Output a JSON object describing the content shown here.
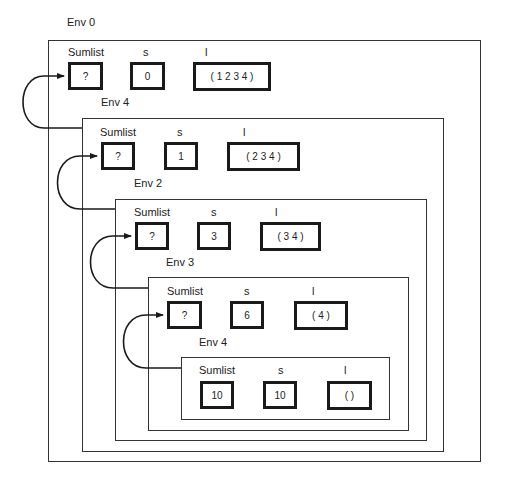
{
  "diagram": {
    "environments": [
      {
        "label": "Env 0",
        "var_labels": [
          "Sumlist",
          "s",
          "l"
        ],
        "values": {
          "sumlist": "?",
          "s": "0",
          "l": "( 1  2  3  4 )"
        }
      },
      {
        "label": "Env 4",
        "var_labels": [
          "Sumlist",
          "s",
          "l"
        ],
        "values": {
          "sumlist": "?",
          "s": "1",
          "l": "( 2  3  4 )"
        }
      },
      {
        "label": "Env 2",
        "var_labels": [
          "Sumlist",
          "s",
          "l"
        ],
        "values": {
          "sumlist": "?",
          "s": "3",
          "l": "( 3  4 )"
        }
      },
      {
        "label": "Env 3",
        "var_labels": [
          "Sumlist",
          "s",
          "l"
        ],
        "values": {
          "sumlist": "?",
          "s": "6",
          "l": "( 4 )"
        }
      },
      {
        "label": "Env 4",
        "var_labels": [
          "Sumlist",
          "s",
          "l"
        ],
        "values": {
          "sumlist": "10",
          "s": "10",
          "l": "( )"
        }
      }
    ],
    "colors": {
      "line": "#333333",
      "box_border": "#1a1a1a",
      "background": "#ffffff"
    }
  }
}
